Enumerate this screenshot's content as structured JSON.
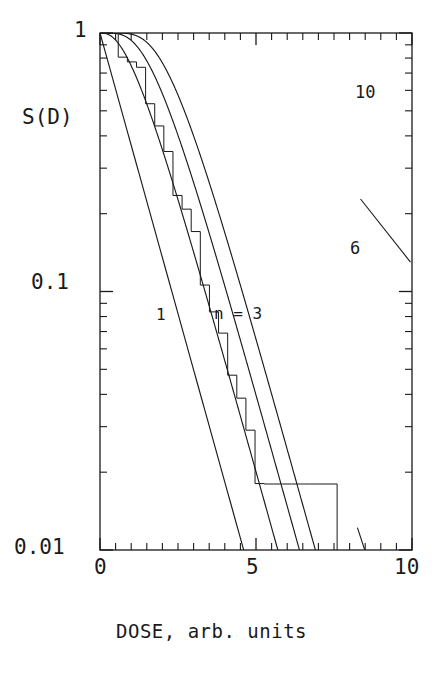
{
  "figure": {
    "kind": "semilog-survival-plot",
    "background": "#ffffff",
    "ink": "#1a1a1a"
  },
  "axes": {
    "y_title": "S(D)",
    "y_tick_labels": [
      "1",
      "0.1",
      "0.01"
    ],
    "y_tick_values": [
      1,
      0.1,
      0.01
    ],
    "x_title": "DOSE, arb. units",
    "x_tick_labels": [
      "0",
      "5",
      "10"
    ],
    "x_tick_values": [
      0,
      5,
      10
    ]
  },
  "annotations": {
    "n1": "1",
    "n3": "n = 3",
    "n6": "6",
    "n10": "10"
  },
  "chart_data": {
    "type": "line",
    "title": "",
    "xlabel": "DOSE, arb. units",
    "ylabel": "S(D)",
    "xlim": [
      0,
      10
    ],
    "ylim": [
      0.01,
      1
    ],
    "yscale": "log",
    "xscale": "linear",
    "grid": false,
    "legend": "inline-curve-labels",
    "xticks": [
      0,
      5,
      10
    ],
    "xminorticks": [
      0.5,
      1,
      1.5,
      2,
      2.5,
      3,
      3.5,
      4,
      4.5,
      5.5,
      6,
      6.5,
      7,
      7.5,
      8,
      8.5,
      9,
      9.5
    ],
    "yticks": [
      1,
      0.1,
      0.01
    ],
    "yminorticks": [
      0.9,
      0.8,
      0.7,
      0.6,
      0.5,
      0.4,
      0.3,
      0.2,
      0.09,
      0.08,
      0.07,
      0.06,
      0.05,
      0.04,
      0.03,
      0.02
    ],
    "model": "S(D) = 1 - (1 - exp(-D/D0))^n",
    "D0": 1.0,
    "series": [
      {
        "name": "1",
        "n": 1,
        "label": "1",
        "style": "solid",
        "x": [
          0,
          0.25,
          0.5,
          0.75,
          1,
          1.25,
          1.5,
          1.75,
          2,
          2.25,
          2.5,
          2.75,
          3,
          3.25,
          3.5,
          3.75,
          4,
          4.25,
          4.5,
          4.605
        ],
        "y": [
          1.0,
          0.7788,
          0.6065,
          0.4724,
          0.3679,
          0.2865,
          0.2231,
          0.1738,
          0.1353,
          0.1054,
          0.0821,
          0.0639,
          0.0498,
          0.0388,
          0.0302,
          0.0235,
          0.0183,
          0.0143,
          0.0111,
          0.01
        ]
      },
      {
        "name": "3",
        "n": 3,
        "label": "n = 3",
        "style": "solid",
        "x": [
          0,
          0.5,
          1,
          1.5,
          2,
          2.5,
          3,
          3.5,
          4,
          4.5,
          5,
          5.5,
          6,
          6.5,
          7,
          7.5,
          8,
          8.4
        ],
        "y": [
          1.0,
          0.9398,
          0.8009,
          0.6391,
          0.488,
          0.3606,
          0.261,
          0.1859,
          0.131,
          0.0916,
          0.0637,
          0.0441,
          0.0304,
          0.0209,
          0.0143,
          0.0098,
          0.0067,
          0.0045
        ]
      },
      {
        "name": "3-montecarlo",
        "n": 3,
        "label": "",
        "style": "step",
        "note": "simulated stair-step histogram overlaying the n = 3 curve; terminates with a vertical drop at D = 7.6",
        "x": [
          0,
          0.6,
          1.2,
          1.7,
          2.1,
          2.5,
          2.9,
          3.2,
          3.5,
          3.8,
          4.1,
          4.4,
          4.7,
          5.0,
          5.3,
          5.6,
          5.9,
          6.2,
          6.5,
          6.8,
          7.1,
          7.4,
          7.6
        ],
        "y": [
          1.0,
          0.92,
          0.75,
          0.61,
          0.5,
          0.405,
          0.325,
          0.275,
          0.23,
          0.195,
          0.162,
          0.136,
          0.113,
          0.094,
          0.078,
          0.064,
          0.053,
          0.0435,
          0.0358,
          0.0294,
          0.024,
          0.0198,
          0.018
        ]
      },
      {
        "name": "6",
        "n": 6,
        "label": "6",
        "style": "solid",
        "x": [
          0,
          0.5,
          1,
          1.5,
          2,
          2.5,
          3,
          3.5,
          4,
          4.5,
          5,
          5.5,
          6,
          6.5,
          7,
          7.5,
          8,
          8.5,
          9,
          9.5,
          10
        ],
        "y": [
          1.0,
          0.9964,
          0.9604,
          0.8698,
          0.7379,
          0.591,
          0.4527,
          0.3354,
          0.2429,
          0.1732,
          0.1221,
          0.0854,
          0.0594,
          0.0412,
          0.0285,
          0.0197,
          0.0136,
          0.0094,
          0.0065,
          0.0045,
          0.0031
        ]
      },
      {
        "name": "10",
        "n": 10,
        "label": "10",
        "style": "solid",
        "x": [
          0,
          0.5,
          1,
          1.5,
          2,
          2.5,
          3,
          3.5,
          4,
          4.5,
          5,
          5.5,
          6,
          6.5,
          7,
          7.5,
          8,
          8.5,
          9,
          9.5,
          10
        ],
        "y": [
          1.0,
          1.0,
          0.9986,
          0.9866,
          0.9418,
          0.852,
          0.7256,
          0.5843,
          0.4497,
          0.3331,
          0.2393,
          0.168,
          0.1162,
          0.0795,
          0.054,
          0.0364,
          0.0245,
          0.0164,
          0.011,
          0.0073,
          0.0049
        ]
      }
    ],
    "leader_lines": [
      {
        "for": "6",
        "from": [
          8.25,
          0.0122
        ],
        "to": [
          9.55,
          0.0041
        ]
      },
      {
        "for": "10",
        "from": [
          8.35,
          0.228
        ],
        "to": [
          9.95,
          0.13
        ]
      }
    ]
  }
}
